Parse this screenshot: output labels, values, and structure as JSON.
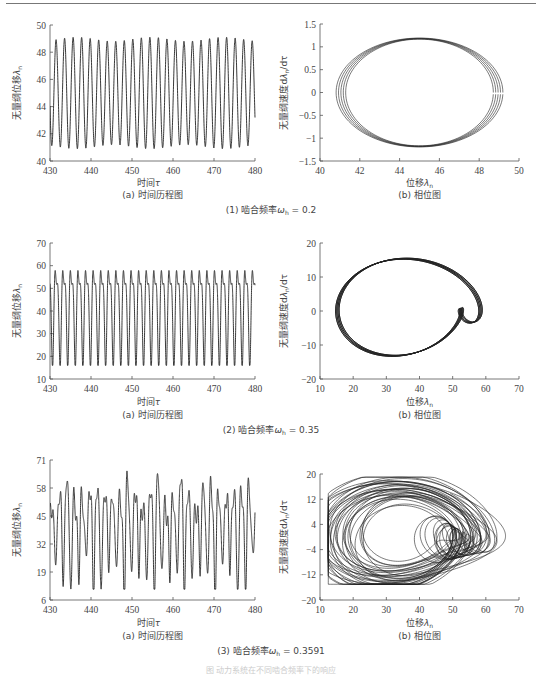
{
  "chart_data": [
    {
      "id": "r1a",
      "type": "line",
      "panel_caption": "(a) 时间历程图",
      "xlabel": "时间τ",
      "ylabel": "无量纲位移λn",
      "xlim": [
        430,
        480
      ],
      "ylim": [
        40,
        50
      ],
      "xticks": [
        430,
        440,
        450,
        460,
        470,
        480
      ],
      "yticks": [
        40,
        42,
        44,
        46,
        48,
        50
      ],
      "signal": {
        "mean": 45,
        "amp": 3.95,
        "period": 2.08,
        "amp_mod": 0.15,
        "mod_period": 18,
        "start_phase": -1.2
      },
      "description": "Near-sinusoidal periodic oscillation between ~41 and ~49"
    },
    {
      "id": "r1b",
      "type": "line",
      "panel_caption": "(b) 相位图",
      "xlabel": "位移λn",
      "ylabel": "无量纲速度dλn/dτ",
      "xlim": [
        40,
        50
      ],
      "ylim": [
        -1.5,
        1.5
      ],
      "xticks": [
        40,
        42,
        44,
        46,
        48,
        50
      ],
      "yticks": [
        -1.5,
        -1,
        -0.5,
        0,
        0.5,
        1,
        1.5
      ],
      "ytick_labels": [
        "−1.5",
        "−1",
        "−0.5",
        "0",
        "0.5",
        "1",
        "1.5"
      ],
      "orbit": {
        "cx": 45,
        "cy": 0,
        "rx": 3.95,
        "ry": 1.18,
        "loops": 5,
        "spread": 0.12
      },
      "description": "Closed elliptical limit cycle centered at (45, 0)"
    },
    {
      "id": "r2a",
      "type": "line",
      "panel_caption": "(a) 时间历程图",
      "xlabel": "时间τ",
      "ylabel": "无量纲位移λn",
      "xlim": [
        430,
        480
      ],
      "ylim": [
        10,
        70
      ],
      "xticks": [
        430,
        440,
        450,
        460,
        470,
        480
      ],
      "yticks": [
        10,
        20,
        30,
        40,
        50,
        60,
        70
      ],
      "signal": {
        "peaks_high": 66,
        "troughs_low": 17,
        "inner_high": 50,
        "inner_low": 35,
        "period": 1.85
      },
      "description": "Period-2 oscillation: large swings 17–66 with secondary 35–50 oscillation"
    },
    {
      "id": "r2b",
      "type": "line",
      "panel_caption": "(b) 相位图",
      "xlabel": "位移λn",
      "ylabel": "无量纲速度dλn/dτ",
      "xlim": [
        10,
        70
      ],
      "ylim": [
        -20,
        20
      ],
      "xticks": [
        10,
        20,
        30,
        40,
        50,
        60,
        70
      ],
      "yticks": [
        -20,
        -10,
        0,
        10,
        20
      ],
      "ytick_labels": [
        "−20",
        "−10",
        "0",
        "10",
        "20"
      ],
      "orbit": {
        "outer": {
          "xmin": 17,
          "xmax": 65.5,
          "ymax": 17.5,
          "ymin": -14.5
        },
        "inner": {
          "cx": 42,
          "cy": 0,
          "rx": 8,
          "ry": 8
        }
      },
      "description": "Double-loop limit cycle (period-2) with large outer loop and small inner loop"
    },
    {
      "id": "r3a",
      "type": "line",
      "panel_caption": "(a) 时间历程图",
      "xlabel": "时间τ",
      "ylabel": "无量纲位移λn",
      "xlim": [
        430,
        480
      ],
      "ylim": [
        6,
        71
      ],
      "xticks": [
        430,
        440,
        450,
        460,
        470,
        480
      ],
      "yticks": [
        6,
        19,
        32,
        45,
        58,
        71
      ],
      "signal": {
        "range": [
          11,
          68
        ],
        "description": "chaotic"
      },
      "description": "Irregular chaotic oscillation between ~11 and ~68"
    },
    {
      "id": "r3b",
      "type": "line",
      "panel_caption": "(b) 相位图",
      "xlabel": "位移λn",
      "ylabel": "无量纲速度dλn/dτ",
      "xlim": [
        10,
        70
      ],
      "ylim": [
        -20,
        20
      ],
      "xticks": [
        10,
        20,
        30,
        40,
        50,
        60,
        70
      ],
      "yticks": [
        -20,
        -12,
        -4,
        4,
        12,
        20
      ],
      "ytick_labels": [
        "−20",
        "−12",
        "−4",
        "4",
        "12",
        "20"
      ],
      "orbit": {
        "outer": {
          "xmin": 12.5,
          "xmax": 68,
          "ymax": 19,
          "ymin": -15
        }
      },
      "description": "Chaotic attractor with many overlapping non-repeating loops"
    }
  ],
  "sections": [
    {
      "caption_prefix": "(1) 啮合频率",
      "omega": "ω",
      "sub": "h",
      "value": " = 0.2"
    },
    {
      "caption_prefix": "(2) 啮合频率",
      "omega": "ω",
      "sub": "h",
      "value": " = 0.35"
    },
    {
      "caption_prefix": "(3) 啮合频率",
      "omega": "ω",
      "sub": "h",
      "value": " = 0.3591"
    }
  ],
  "figure_caption": "图        动力系统在不同啮合频率下的响应"
}
